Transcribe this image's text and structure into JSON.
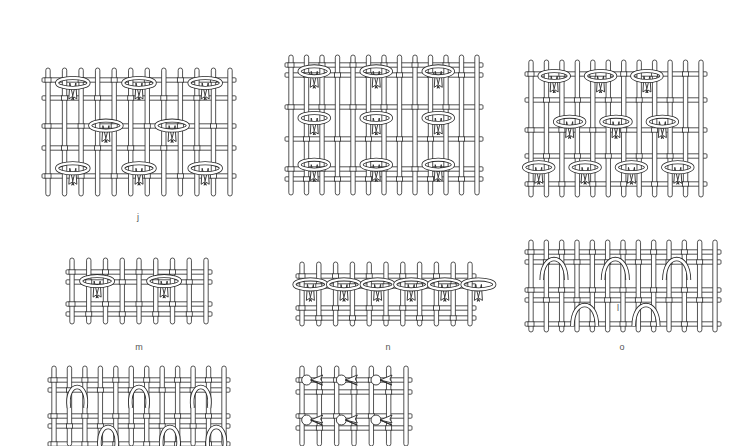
{
  "figure": {
    "colors": {
      "background": "#ffffff",
      "ink": "#2a2a2a"
    },
    "panels": [
      {
        "id": "j",
        "label": "j",
        "pattern": "ring-knots-staggered",
        "x": 42,
        "y": 68,
        "w": 194,
        "h": 128,
        "warps": 12,
        "wefts": [
          12,
          30,
          58,
          80,
          108
        ],
        "knots": [
          [
            1,
            0
          ],
          [
            5,
            0
          ],
          [
            9,
            0
          ],
          [
            3,
            1
          ],
          [
            7,
            1
          ],
          [
            1,
            2
          ],
          [
            5,
            2
          ],
          [
            9,
            2
          ]
        ],
        "label_pos": [
          138,
          218
        ]
      },
      {
        "id": "k",
        "label": "k",
        "pattern": "ring-knots-columns",
        "x": 285,
        "y": 55,
        "w": 198,
        "h": 140,
        "warps": 13,
        "wefts": [
          10,
          20,
          52,
          84,
          114,
          124
        ],
        "knots": [
          [
            1,
            0
          ],
          [
            5,
            0
          ],
          [
            9,
            0
          ],
          [
            1,
            1
          ],
          [
            5,
            1
          ],
          [
            9,
            1
          ],
          [
            1,
            2
          ],
          [
            5,
            2
          ],
          [
            9,
            2
          ]
        ],
        "label_pos": [
          387,
          309
        ]
      },
      {
        "id": "l",
        "label": "l",
        "pattern": "ring-knots-staggered-offset",
        "x": 525,
        "y": 60,
        "w": 182,
        "h": 137,
        "warps": 12,
        "wefts": [
          14,
          40,
          70,
          96,
          124
        ],
        "knots": [
          [
            1,
            0
          ],
          [
            4,
            0
          ],
          [
            7,
            0
          ],
          [
            2,
            1
          ],
          [
            5,
            1
          ],
          [
            8,
            1
          ],
          [
            0,
            2
          ],
          [
            3,
            2
          ],
          [
            6,
            2
          ],
          [
            9,
            2
          ]
        ],
        "label_pos": [
          618,
          309
        ]
      },
      {
        "id": "m",
        "label": "m",
        "pattern": "paired-loop-knots",
        "x": 66,
        "y": 258,
        "w": 146,
        "h": 66,
        "warps": 9,
        "wefts": [
          14,
          24,
          46,
          56
        ],
        "knots": [
          [
            1,
            0
          ],
          [
            5,
            0
          ]
        ],
        "label_pos": [
          139,
          348
        ]
      },
      {
        "id": "n",
        "label": "n",
        "pattern": "continuous-ring-knots",
        "x": 296,
        "y": 262,
        "w": 180,
        "h": 64,
        "warps": 11,
        "wefts": [
          14,
          24,
          46,
          56
        ],
        "knots": [
          [
            0,
            0
          ],
          [
            2,
            0
          ],
          [
            4,
            0
          ],
          [
            6,
            0
          ],
          [
            8,
            0
          ],
          [
            10,
            0
          ]
        ],
        "label_pos": [
          388,
          348
        ]
      },
      {
        "id": "o",
        "label": "o",
        "pattern": "horseshoe-loops",
        "x": 525,
        "y": 240,
        "w": 196,
        "h": 92,
        "warps": 13,
        "wefts": [
          12,
          22,
          50,
          60,
          84
        ],
        "knots": [
          [
            1,
            0
          ],
          [
            5,
            0
          ],
          [
            9,
            0
          ],
          [
            3,
            1
          ],
          [
            7,
            1
          ]
        ],
        "label_pos": [
          622,
          348
        ]
      },
      {
        "id": "p",
        "label": "",
        "pattern": "upright-loops",
        "x": 48,
        "y": 366,
        "w": 182,
        "h": 80,
        "warps": 12,
        "wefts": [
          14,
          24,
          50,
          60,
          78
        ],
        "knots": [
          [
            1,
            0
          ],
          [
            5,
            0
          ],
          [
            9,
            0
          ],
          [
            3,
            1
          ],
          [
            7,
            1
          ],
          [
            10,
            1
          ]
        ],
        "label_pos": null
      },
      {
        "id": "q",
        "label": "",
        "pattern": "cross-knots",
        "x": 296,
        "y": 366,
        "w": 116,
        "h": 80,
        "warps": 7,
        "wefts": [
          14,
          26,
          50,
          62
        ],
        "knots": [
          [
            0,
            0
          ],
          [
            2,
            0
          ],
          [
            4,
            0
          ],
          [
            0,
            1
          ],
          [
            2,
            1
          ],
          [
            4,
            1
          ]
        ],
        "label_pos": null
      }
    ]
  }
}
